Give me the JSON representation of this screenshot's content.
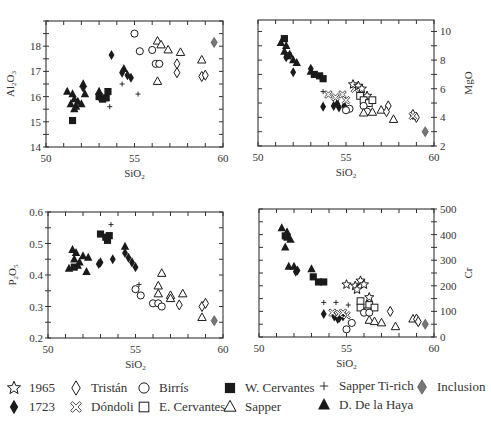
{
  "chart_data": [
    {
      "type": "scatter",
      "id": "al2o3",
      "xlabel": "SiO2",
      "ylabel": "Al2O3",
      "xlim": [
        50,
        60
      ],
      "ylim": [
        14,
        19
      ],
      "xticks": [
        50,
        55,
        60
      ],
      "yticks": [
        14,
        15,
        16,
        17,
        18
      ],
      "yaxis_side": "left",
      "frame": {
        "x0": 46,
        "y0": 21,
        "x1": 223,
        "y1": 147
      },
      "points": [
        {
          "s": "dh",
          "x": 51.2,
          "y": 16.2
        },
        {
          "s": "dh",
          "x": 51.5,
          "y": 16.1
        },
        {
          "s": "dh",
          "x": 51.6,
          "y": 15.9
        },
        {
          "s": "dh",
          "x": 51.4,
          "y": 15.7
        },
        {
          "s": "dh",
          "x": 51.7,
          "y": 15.6
        },
        {
          "s": "dh",
          "x": 51.8,
          "y": 15.8
        },
        {
          "s": "dh",
          "x": 52.0,
          "y": 15.7
        },
        {
          "s": "dh",
          "x": 52.1,
          "y": 16.5
        },
        {
          "s": "dh",
          "x": 52.2,
          "y": 16.1
        },
        {
          "s": "dh",
          "x": 51.6,
          "y": 15.5
        },
        {
          "s": "dh",
          "x": 53.0,
          "y": 16.2
        },
        {
          "s": "dh",
          "x": 54.4,
          "y": 17.1
        },
        {
          "s": "wc",
          "x": 51.5,
          "y": 15.05
        },
        {
          "s": "wc",
          "x": 53.0,
          "y": 16.0
        },
        {
          "s": "wc",
          "x": 53.2,
          "y": 15.9
        },
        {
          "s": "wc",
          "x": 53.5,
          "y": 16.2
        },
        {
          "s": "wc",
          "x": 53.4,
          "y": 15.95
        },
        {
          "s": "d1723",
          "x": 53.7,
          "y": 17.65
        },
        {
          "s": "d1723",
          "x": 54.3,
          "y": 16.95
        },
        {
          "s": "d1723",
          "x": 54.6,
          "y": 16.85
        },
        {
          "s": "d1723",
          "x": 54.8,
          "y": 16.75
        },
        {
          "s": "d1723",
          "x": 52.1,
          "y": 16.35
        },
        {
          "s": "d1723",
          "x": 53.0,
          "y": 16.0
        },
        {
          "s": "str",
          "x": 54.3,
          "y": 16.5
        },
        {
          "s": "str",
          "x": 53.6,
          "y": 15.6
        },
        {
          "s": "str",
          "x": 55.2,
          "y": 16.1
        },
        {
          "s": "bir",
          "x": 55.0,
          "y": 18.5
        },
        {
          "s": "bir",
          "x": 55.3,
          "y": 17.8
        },
        {
          "s": "bir",
          "x": 56.0,
          "y": 17.85
        },
        {
          "s": "bir",
          "x": 56.2,
          "y": 17.3
        },
        {
          "s": "bir",
          "x": 56.4,
          "y": 17.3
        },
        {
          "s": "sap",
          "x": 56.3,
          "y": 18.2
        },
        {
          "s": "sap",
          "x": 56.5,
          "y": 18.05
        },
        {
          "s": "sap",
          "x": 56.9,
          "y": 17.85
        },
        {
          "s": "sap",
          "x": 57.6,
          "y": 17.75
        },
        {
          "s": "sap",
          "x": 56.3,
          "y": 16.6
        },
        {
          "s": "sap",
          "x": 58.8,
          "y": 17.45
        },
        {
          "s": "tri",
          "x": 57.4,
          "y": 17.3
        },
        {
          "s": "tri",
          "x": 57.4,
          "y": 16.95
        },
        {
          "s": "tri",
          "x": 58.8,
          "y": 16.8
        },
        {
          "s": "tri",
          "x": 59.0,
          "y": 16.85
        },
        {
          "s": "inc",
          "x": 59.5,
          "y": 18.15
        }
      ]
    },
    {
      "type": "scatter",
      "id": "mgo",
      "xlabel": "SiO2",
      "ylabel": "MgO",
      "xlim": [
        50,
        60
      ],
      "ylim": [
        2,
        10.8
      ],
      "xticks": [
        50,
        55,
        60
      ],
      "yticks": [
        2,
        4,
        6,
        8,
        10
      ],
      "yaxis_side": "right",
      "frame": {
        "x0": 258,
        "y0": 20,
        "x1": 434,
        "y1": 146
      },
      "points": [
        {
          "s": "wc",
          "x": 51.5,
          "y": 9.5
        },
        {
          "s": "dh",
          "x": 51.3,
          "y": 9.2
        },
        {
          "s": "dh",
          "x": 51.6,
          "y": 9.0
        },
        {
          "s": "dh",
          "x": 51.5,
          "y": 8.6
        },
        {
          "s": "dh",
          "x": 51.8,
          "y": 8.4
        },
        {
          "s": "wc",
          "x": 51.7,
          "y": 8.3
        },
        {
          "s": "dh",
          "x": 52.0,
          "y": 8.0
        },
        {
          "s": "dh",
          "x": 52.2,
          "y": 7.8
        },
        {
          "s": "d1723",
          "x": 51.6,
          "y": 8.2
        },
        {
          "s": "d1723",
          "x": 52.0,
          "y": 7.15
        },
        {
          "s": "d1723",
          "x": 53.0,
          "y": 7.4
        },
        {
          "s": "dh",
          "x": 53.0,
          "y": 7.2
        },
        {
          "s": "wc",
          "x": 53.2,
          "y": 7.0
        },
        {
          "s": "wc",
          "x": 53.5,
          "y": 6.9
        },
        {
          "s": "wc",
          "x": 53.7,
          "y": 6.7
        },
        {
          "s": "str",
          "x": 53.7,
          "y": 5.8
        },
        {
          "s": "d1723",
          "x": 53.7,
          "y": 4.75
        },
        {
          "s": "d1723",
          "x": 54.3,
          "y": 4.8
        },
        {
          "s": "d1723",
          "x": 54.6,
          "y": 4.7
        },
        {
          "s": "d1723",
          "x": 54.9,
          "y": 4.8
        },
        {
          "s": "d1723",
          "x": 54.5,
          "y": 4.95
        },
        {
          "s": "don",
          "x": 54.0,
          "y": 5.6
        },
        {
          "s": "don",
          "x": 54.4,
          "y": 5.4
        },
        {
          "s": "don",
          "x": 54.8,
          "y": 5.6
        },
        {
          "s": "don",
          "x": 55.0,
          "y": 5.2
        },
        {
          "s": "don",
          "x": 55.5,
          "y": 6.0
        },
        {
          "s": "y1965",
          "x": 55.4,
          "y": 6.3
        },
        {
          "s": "y1965",
          "x": 55.7,
          "y": 6.2
        },
        {
          "s": "y1965",
          "x": 55.9,
          "y": 6.0
        },
        {
          "s": "y1965",
          "x": 56.2,
          "y": 5.5
        },
        {
          "s": "ec",
          "x": 55.8,
          "y": 5.5
        },
        {
          "s": "ec",
          "x": 56.0,
          "y": 5.2
        },
        {
          "s": "ec",
          "x": 56.3,
          "y": 5.0
        },
        {
          "s": "ec",
          "x": 56.5,
          "y": 5.2
        },
        {
          "s": "bir",
          "x": 55.2,
          "y": 4.6
        },
        {
          "s": "bir",
          "x": 55.0,
          "y": 4.5
        },
        {
          "s": "bir",
          "x": 56.0,
          "y": 4.8
        },
        {
          "s": "bir",
          "x": 56.2,
          "y": 4.4
        },
        {
          "s": "sap",
          "x": 56.0,
          "y": 4.3
        },
        {
          "s": "sap",
          "x": 56.5,
          "y": 4.35
        },
        {
          "s": "sap",
          "x": 57.0,
          "y": 4.5
        },
        {
          "s": "sap",
          "x": 57.7,
          "y": 3.85
        },
        {
          "s": "tri",
          "x": 57.4,
          "y": 4.8
        },
        {
          "s": "tri",
          "x": 57.3,
          "y": 4.4
        },
        {
          "s": "tri",
          "x": 58.8,
          "y": 4.2
        },
        {
          "s": "tri",
          "x": 59.0,
          "y": 4.0
        },
        {
          "s": "don",
          "x": 58.8,
          "y": 4.1
        },
        {
          "s": "inc",
          "x": 59.5,
          "y": 3.0
        }
      ]
    },
    {
      "type": "scatter",
      "id": "p2o5",
      "xlabel": "SiO2",
      "ylabel": "P2O5",
      "xlim": [
        50,
        60
      ],
      "ylim": [
        0.2,
        0.6
      ],
      "xticks": [
        50,
        55,
        60
      ],
      "yticks": [
        0.2,
        0.3,
        0.4,
        0.5,
        0.6
      ],
      "ytick_labels": [
        "0.2",
        "0.3",
        "0.4",
        "0.5",
        "0.6"
      ],
      "yaxis_side": "left",
      "frame": {
        "x0": 48,
        "y0": 212,
        "x1": 223,
        "y1": 338
      },
      "points": [
        {
          "s": "dh",
          "x": 51.2,
          "y": 0.42
        },
        {
          "s": "dh",
          "x": 51.4,
          "y": 0.48
        },
        {
          "s": "dh",
          "x": 51.5,
          "y": 0.45
        },
        {
          "s": "dh",
          "x": 51.6,
          "y": 0.47
        },
        {
          "s": "dh",
          "x": 51.8,
          "y": 0.44
        },
        {
          "s": "dh",
          "x": 52.0,
          "y": 0.46
        },
        {
          "s": "dh",
          "x": 52.2,
          "y": 0.41
        },
        {
          "s": "dh",
          "x": 51.7,
          "y": 0.43
        },
        {
          "s": "dh",
          "x": 52.3,
          "y": 0.455
        },
        {
          "s": "dh",
          "x": 54.4,
          "y": 0.49
        },
        {
          "s": "wc",
          "x": 51.5,
          "y": 0.425
        },
        {
          "s": "wc",
          "x": 53.0,
          "y": 0.53
        },
        {
          "s": "wc",
          "x": 53.3,
          "y": 0.52
        },
        {
          "s": "wc",
          "x": 53.5,
          "y": 0.525
        },
        {
          "s": "wc",
          "x": 53.4,
          "y": 0.51
        },
        {
          "s": "d1723",
          "x": 53.0,
          "y": 0.44
        },
        {
          "s": "d1723",
          "x": 53.7,
          "y": 0.45
        },
        {
          "s": "d1723",
          "x": 54.4,
          "y": 0.47
        },
        {
          "s": "d1723",
          "x": 54.6,
          "y": 0.455
        },
        {
          "s": "d1723",
          "x": 54.8,
          "y": 0.44
        },
        {
          "s": "d1723",
          "x": 55.0,
          "y": 0.425
        },
        {
          "s": "d1723",
          "x": 52.9,
          "y": 0.435
        },
        {
          "s": "str",
          "x": 53.6,
          "y": 0.56
        },
        {
          "s": "str",
          "x": 55.2,
          "y": 0.37
        },
        {
          "s": "bir",
          "x": 55.0,
          "y": 0.355
        },
        {
          "s": "bir",
          "x": 55.3,
          "y": 0.335
        },
        {
          "s": "bir",
          "x": 56.0,
          "y": 0.31
        },
        {
          "s": "bir",
          "x": 56.3,
          "y": 0.31
        },
        {
          "s": "bir",
          "x": 56.5,
          "y": 0.3
        },
        {
          "s": "sap",
          "x": 56.5,
          "y": 0.405
        },
        {
          "s": "sap",
          "x": 56.3,
          "y": 0.365
        },
        {
          "s": "sap",
          "x": 56.3,
          "y": 0.34
        },
        {
          "s": "sap",
          "x": 57.0,
          "y": 0.335
        },
        {
          "s": "sap",
          "x": 57.0,
          "y": 0.325
        },
        {
          "s": "sap",
          "x": 57.7,
          "y": 0.34
        },
        {
          "s": "sap",
          "x": 58.8,
          "y": 0.265
        },
        {
          "s": "tri",
          "x": 57.5,
          "y": 0.305
        },
        {
          "s": "tri",
          "x": 58.8,
          "y": 0.3
        },
        {
          "s": "tri",
          "x": 59.0,
          "y": 0.31
        },
        {
          "s": "inc",
          "x": 59.5,
          "y": 0.255
        }
      ]
    },
    {
      "type": "scatter",
      "id": "cr",
      "xlabel": "SiO2",
      "ylabel": "Cr",
      "xlim": [
        50,
        60
      ],
      "ylim": [
        0,
        500
      ],
      "xticks": [
        50,
        55,
        60
      ],
      "yticks": [
        0,
        100,
        200,
        300,
        400,
        500
      ],
      "yaxis_side": "right",
      "frame": {
        "x0": 259,
        "y0": 209,
        "x1": 434,
        "y1": 337
      },
      "points": [
        {
          "s": "dh",
          "x": 51.3,
          "y": 425
        },
        {
          "s": "dh",
          "x": 51.6,
          "y": 410
        },
        {
          "s": "wc",
          "x": 51.5,
          "y": 395
        },
        {
          "s": "dh",
          "x": 51.8,
          "y": 380
        },
        {
          "s": "dh",
          "x": 51.5,
          "y": 350
        },
        {
          "s": "wc",
          "x": 51.6,
          "y": 390
        },
        {
          "s": "dh",
          "x": 51.7,
          "y": 275
        },
        {
          "s": "dh",
          "x": 52.0,
          "y": 275
        },
        {
          "s": "d1723",
          "x": 52.1,
          "y": 255
        },
        {
          "s": "d1723",
          "x": 52.2,
          "y": 260
        },
        {
          "s": "dh",
          "x": 53.0,
          "y": 265
        },
        {
          "s": "wc",
          "x": 53.1,
          "y": 235
        },
        {
          "s": "wc",
          "x": 53.4,
          "y": 215
        },
        {
          "s": "wc",
          "x": 53.7,
          "y": 215
        },
        {
          "s": "str",
          "x": 53.7,
          "y": 135
        },
        {
          "s": "str",
          "x": 54.4,
          "y": 135
        },
        {
          "s": "str",
          "x": 55.1,
          "y": 125
        },
        {
          "s": "d1723",
          "x": 53.7,
          "y": 90
        },
        {
          "s": "d1723",
          "x": 54.3,
          "y": 80
        },
        {
          "s": "d1723",
          "x": 54.6,
          "y": 75
        },
        {
          "s": "d1723",
          "x": 54.8,
          "y": 80
        },
        {
          "s": "d1723",
          "x": 54.5,
          "y": 70
        },
        {
          "s": "don",
          "x": 54.2,
          "y": 95
        },
        {
          "s": "don",
          "x": 54.6,
          "y": 90
        },
        {
          "s": "don",
          "x": 55.0,
          "y": 85
        },
        {
          "s": "don",
          "x": 54.8,
          "y": 95
        },
        {
          "s": "y1965",
          "x": 55.0,
          "y": 205
        },
        {
          "s": "y1965",
          "x": 55.5,
          "y": 200
        },
        {
          "s": "y1965",
          "x": 55.8,
          "y": 220
        },
        {
          "s": "y1965",
          "x": 56.0,
          "y": 205
        },
        {
          "s": "y1965",
          "x": 55.6,
          "y": 185
        },
        {
          "s": "y1965",
          "x": 56.3,
          "y": 155
        },
        {
          "s": "ec",
          "x": 55.8,
          "y": 140
        },
        {
          "s": "ec",
          "x": 55.8,
          "y": 115
        },
        {
          "s": "ec",
          "x": 56.3,
          "y": 125
        },
        {
          "s": "ec",
          "x": 56.6,
          "y": 115
        },
        {
          "s": "ec",
          "x": 56.2,
          "y": 100
        },
        {
          "s": "bir",
          "x": 55.0,
          "y": 30
        },
        {
          "s": "bir",
          "x": 55.3,
          "y": 55
        },
        {
          "s": "bir",
          "x": 56.0,
          "y": 95
        },
        {
          "s": "bir",
          "x": 56.3,
          "y": 95
        },
        {
          "s": "sap",
          "x": 56.3,
          "y": 65
        },
        {
          "s": "sap",
          "x": 56.6,
          "y": 60
        },
        {
          "s": "sap",
          "x": 57.0,
          "y": 55
        },
        {
          "s": "sap",
          "x": 57.8,
          "y": 40
        },
        {
          "s": "sap",
          "x": 58.8,
          "y": 70
        },
        {
          "s": "tri",
          "x": 57.5,
          "y": 100
        },
        {
          "s": "tri",
          "x": 59.0,
          "y": 70
        },
        {
          "s": "tri",
          "x": 59.1,
          "y": 60
        },
        {
          "s": "inc",
          "x": 59.5,
          "y": 50
        }
      ]
    }
  ],
  "legend": {
    "items": [
      {
        "key": "y1965",
        "label": "1965",
        "symbol": "star-open"
      },
      {
        "key": "tri",
        "label": "Tristán",
        "symbol": "diamond-open"
      },
      {
        "key": "bir",
        "label": "Birrís",
        "symbol": "circle-open"
      },
      {
        "key": "wc",
        "label": "W. Cervantes",
        "symbol": "square-filled"
      },
      {
        "key": "str",
        "label": "Sapper Ti-rich",
        "symbol": "plus"
      },
      {
        "key": "inc",
        "label": "Inclusion",
        "symbol": "diamond-gray"
      },
      {
        "key": "d1723",
        "label": "1723",
        "symbol": "diamond-filled"
      },
      {
        "key": "don",
        "label": "Dóndoli",
        "symbol": "x-open"
      },
      {
        "key": "ec",
        "label": "E. Cervantes",
        "symbol": "square-open"
      },
      {
        "key": "sap",
        "label": "Sapper",
        "symbol": "triangle-open"
      },
      {
        "key": "dh",
        "label": "D. De la Haya",
        "symbol": "triangle-filled"
      }
    ]
  },
  "colors": {
    "ink": "#1a1a1a",
    "inclusion": "#777777",
    "axis": "#333333"
  }
}
